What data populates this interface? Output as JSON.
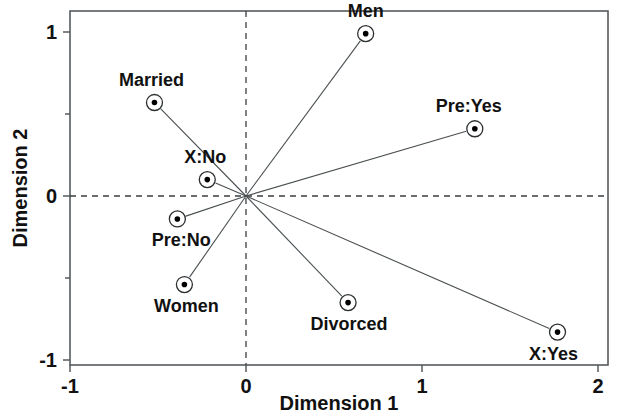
{
  "chart_data": {
    "type": "scatter",
    "title": "",
    "xlabel": "Dimension 1",
    "ylabel": "Dimension 2",
    "xlim": [
      -1,
      2
    ],
    "ylim": [
      -1,
      1
    ],
    "xticks": [
      -1,
      0,
      1,
      2
    ],
    "xticklabels": [
      "-1",
      "0",
      "1",
      "2"
    ],
    "yticks": [
      -1,
      0,
      1
    ],
    "yticklabels": [
      "-1",
      "0",
      "1"
    ],
    "yminorticks": [
      -0.5,
      0.5
    ],
    "grid": false,
    "legend": "none",
    "reference_lines": {
      "vertical_at_x": 0,
      "horizontal_at_y": 0,
      "style": "dashed"
    },
    "origin": {
      "x": 0,
      "y": 0
    },
    "points": [
      {
        "label": "Men",
        "x": 0.68,
        "y": 0.99,
        "label_dx": 0,
        "label_dy": -17,
        "anchor": "middle"
      },
      {
        "label": "Married",
        "x": -0.52,
        "y": 0.57,
        "label_dx": -3,
        "label_dy": -17,
        "anchor": "middle"
      },
      {
        "label": "Pre:Yes",
        "x": 1.3,
        "y": 0.41,
        "label_dx": -6,
        "label_dy": -17,
        "anchor": "middle"
      },
      {
        "label": "X:No",
        "x": -0.22,
        "y": 0.1,
        "label_dx": -2,
        "label_dy": -17,
        "anchor": "middle"
      },
      {
        "label": "Pre:No",
        "x": -0.39,
        "y": -0.14,
        "label_dx": 4,
        "label_dy": 27,
        "anchor": "middle"
      },
      {
        "label": "Women",
        "x": -0.35,
        "y": -0.54,
        "label_dx": 2,
        "label_dy": 27,
        "anchor": "middle"
      },
      {
        "label": "Divorced",
        "x": 0.58,
        "y": -0.65,
        "label_dx": 1,
        "label_dy": 27,
        "anchor": "middle"
      },
      {
        "label": "X:Yes",
        "x": 1.77,
        "y": -0.83,
        "label_dx": -4,
        "label_dy": 28,
        "anchor": "middle"
      }
    ],
    "colors": {
      "frame": "#555b5e",
      "reference_line": "#3a3f42",
      "spoke": "#4a4f52",
      "marker_fill": "#000000",
      "marker_ring": "#2b2f31",
      "background": "#ffffff",
      "text": "#111111"
    }
  }
}
